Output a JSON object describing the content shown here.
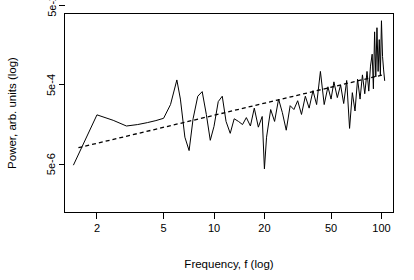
{
  "chart_data": {
    "type": "line",
    "title": "",
    "subtitle": "",
    "xlabel": "Frequency, f (log)",
    "ylabel": "Power, arb. units (log)",
    "xscale": "log",
    "yscale": "log",
    "xlim": [
      1.28,
      118
    ],
    "ylim": [
      3e-07,
      0.032
    ],
    "grid": false,
    "legend": null,
    "legend_position": "none",
    "box": true,
    "xticks": [
      2,
      5,
      10,
      20,
      50,
      100
    ],
    "xtick_labels": [
      "2",
      "5",
      "10",
      "20",
      "50",
      "100"
    ],
    "yticks": [
      5e-06,
      0.0005,
      0.05
    ],
    "ytick_labels": [
      "5e-6",
      "5e-4",
      "5e-2"
    ],
    "annotations": [],
    "series": [
      {
        "name": "periodogram",
        "style": "solid",
        "color": "#000000",
        "x": [
          1.45,
          2.0,
          2.5,
          3.0,
          3.5,
          4.0,
          4.5,
          5.0,
          5.5,
          6.0,
          6.3,
          6.7,
          7.1,
          7.5,
          8.0,
          8.5,
          9.0,
          9.5,
          10.0,
          10.6,
          11.2,
          11.8,
          12.5,
          13.2,
          14.0,
          14.8,
          15.6,
          16.5,
          17.4,
          18.4,
          19.4,
          20.0,
          20.6,
          21.8,
          23.0,
          24.3,
          25.6,
          27.0,
          28.5,
          30.0,
          31.6,
          33.3,
          35.1,
          37.0,
          39.0,
          41.0,
          43.2,
          45.5,
          47.9,
          50.0,
          52.0,
          54.5,
          57.0,
          59.5,
          62.0,
          64.5,
          67.0,
          69.5,
          72.0,
          74.5,
          77.0,
          79.5,
          82.0,
          84.0,
          86.0,
          88.0,
          89.5,
          91.0,
          92.5,
          94.0,
          95.5,
          97.0,
          98.5,
          100.0,
          101.5,
          103.0,
          104.5
        ],
        "y": [
          4.8e-06,
          8.8e-05,
          6.4e-05,
          4.6e-05,
          5e-05,
          5.6e-05,
          6.3e-05,
          7.2e-05,
          0.00016,
          0.00067,
          0.00022,
          2.4e-05,
          1.1e-05,
          7e-05,
          0.00026,
          0.00034,
          9e-05,
          2e-05,
          4.5e-05,
          0.00019,
          0.00026,
          6e-05,
          3e-05,
          7e-05,
          6e-05,
          5e-05,
          7.5e-05,
          4.6e-05,
          0.00013,
          4.3e-05,
          8e-05,
          3.8e-06,
          2.4e-05,
          0.00012,
          6e-05,
          0.00022,
          0.0001,
          3.6e-05,
          0.00015,
          0.00012,
          0.0002,
          9e-05,
          0.00026,
          0.00013,
          0.00036,
          0.00016,
          0.0011,
          0.00016,
          0.00045,
          0.00022,
          0.0006,
          0.00024,
          0.0005,
          0.00017,
          0.00065,
          4e-05,
          0.00032,
          0.00011,
          0.0007,
          0.00022,
          0.0009,
          0.0003,
          0.0011,
          0.00035,
          0.0015,
          0.003,
          0.0004,
          0.011,
          0.0008,
          0.014,
          0.0011,
          0.007,
          0.0009,
          0.021,
          0.0026,
          0.0012,
          0.00065
        ]
      },
      {
        "name": "fitted trend",
        "style": "dashed",
        "color": "#000000",
        "x": [
          1.55,
          104.0
        ],
        "y": [
          1.3e-05,
          0.00092
        ]
      }
    ]
  },
  "axes": {
    "x": {
      "label": "Frequency, f (log)",
      "tick_labels": [
        "2",
        "5",
        "10",
        "20",
        "50",
        "100"
      ]
    },
    "y": {
      "label": "Power, arb. units (log)",
      "tick_labels": [
        "5e-6",
        "5e-4",
        "5e-2"
      ]
    }
  }
}
